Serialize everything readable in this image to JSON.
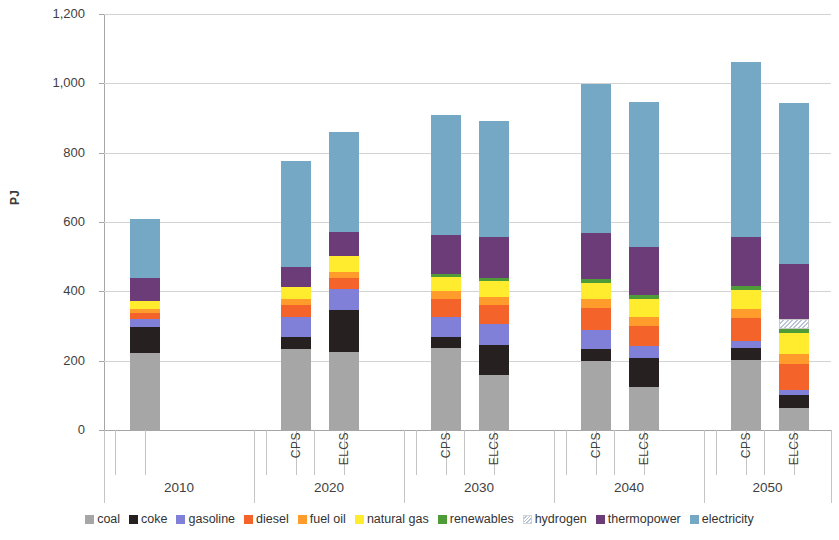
{
  "chart_data": {
    "type": "bar",
    "title": "",
    "subtitle": "",
    "stacked": true,
    "xlabel": "",
    "ylabel": "PJ",
    "ylim": [
      0,
      1200
    ],
    "ytick_step": 200,
    "ytick_labels": [
      "1,200",
      "1,000",
      "800",
      "600",
      "400",
      "200",
      "0"
    ],
    "ytick_values": [
      1200,
      1000,
      800,
      600,
      400,
      200,
      0
    ],
    "grid": true,
    "legend_position": "bottom",
    "groups": [
      "2010",
      "2020",
      "2030",
      "2040",
      "2050"
    ],
    "scenarios": [
      "CPS",
      "ELCS"
    ],
    "categories": [
      "2010",
      "2020 CPS",
      "2020 ELCS",
      "2030 CPS",
      "2030 ELCS",
      "2040 CPS",
      "2040 ELCS",
      "2050 CPS",
      "2050 ELCS"
    ],
    "series": [
      {
        "name": "coal",
        "color": "#a6a6a6",
        "values": [
          222,
          235,
          224,
          236,
          160,
          200,
          124,
          203,
          64
        ]
      },
      {
        "name": "coke",
        "color": "#262020",
        "values": [
          76,
          33,
          121,
          33,
          86,
          33,
          83,
          33,
          36
        ]
      },
      {
        "name": "gasoline",
        "color": "#8080d8",
        "values": [
          22,
          58,
          62,
          57,
          60,
          55,
          35,
          20,
          16
        ]
      },
      {
        "name": "diesel",
        "color": "#f4642a",
        "values": [
          18,
          34,
          32,
          53,
          54,
          64,
          58,
          66,
          74
        ]
      },
      {
        "name": "fuel oil",
        "color": "#ff9c2b",
        "values": [
          12,
          19,
          18,
          22,
          24,
          26,
          26,
          28,
          30
        ]
      },
      {
        "name": "natural gas",
        "color": "#ffec2e",
        "values": [
          23,
          34,
          45,
          40,
          47,
          47,
          53,
          53,
          60
        ]
      },
      {
        "name": "renewables",
        "color": "#4f9b38",
        "values": [
          0,
          0,
          0,
          8,
          7,
          10,
          10,
          11,
          12
        ]
      },
      {
        "name": "hydrogen",
        "color": "#ffffff",
        "hatched": true,
        "values": [
          0,
          0,
          0,
          0,
          0,
          0,
          0,
          0,
          29
        ]
      },
      {
        "name": "thermopower",
        "color": "#6b3c78",
        "values": [
          65,
          58,
          68,
          113,
          118,
          133,
          139,
          143,
          157
        ]
      },
      {
        "name": "electricity",
        "color": "#74a8c4",
        "values": [
          170,
          304,
          290,
          346,
          334,
          429,
          418,
          506,
          464
        ]
      }
    ],
    "totals": [
      608,
      775,
      860,
      908,
      890,
      997,
      946,
      1063,
      942
    ],
    "data_labels_shown": false
  },
  "legend": {
    "items": [
      {
        "label": "coal",
        "icon": "square-swatch-icon"
      },
      {
        "label": "coke",
        "icon": "square-swatch-icon"
      },
      {
        "label": "gasoline",
        "icon": "square-swatch-icon"
      },
      {
        "label": "diesel",
        "icon": "square-swatch-icon"
      },
      {
        "label": "fuel oil",
        "icon": "square-swatch-icon"
      },
      {
        "label": "natural gas",
        "icon": "square-swatch-icon"
      },
      {
        "label": "renewables",
        "icon": "square-swatch-icon"
      },
      {
        "label": "hydrogen",
        "icon": "hatched-swatch-icon"
      },
      {
        "label": "thermopower",
        "icon": "square-swatch-icon"
      },
      {
        "label": "electricity",
        "icon": "square-swatch-icon"
      }
    ]
  },
  "xaxis": {
    "groups": [
      {
        "year": "2010",
        "scenarios": [
          ""
        ]
      },
      {
        "year": "2020",
        "scenarios": [
          "CPS",
          "ELCS"
        ]
      },
      {
        "year": "2030",
        "scenarios": [
          "CPS",
          "ELCS"
        ]
      },
      {
        "year": "2040",
        "scenarios": [
          "CPS",
          "ELCS"
        ]
      },
      {
        "year": "2050",
        "scenarios": [
          "CPS",
          "ELCS"
        ]
      }
    ]
  },
  "yaxis": {
    "title": "PJ"
  }
}
